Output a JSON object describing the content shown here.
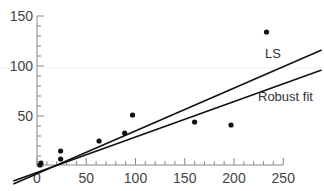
{
  "chart_data": {
    "type": "scatter",
    "title": "",
    "xlabel": "",
    "ylabel": "",
    "xlim": [
      0,
      250
    ],
    "ylim": [
      0,
      150
    ],
    "x_ticks": [
      0,
      50,
      100,
      150,
      200,
      250
    ],
    "y_ticks": [
      50,
      100,
      150
    ],
    "x_tick_labels": [
      "0",
      "50",
      "100",
      "150",
      "200",
      "250"
    ],
    "y_tick_labels": [
      "50",
      "100",
      "150"
    ],
    "grid": false,
    "points": [
      {
        "x": 3,
        "y": 1
      },
      {
        "x": 4,
        "y": 3
      },
      {
        "x": 24,
        "y": 15
      },
      {
        "x": 24,
        "y": 7
      },
      {
        "x": 63,
        "y": 25
      },
      {
        "x": 89,
        "y": 33
      },
      {
        "x": 97,
        "y": 51
      },
      {
        "x": 160,
        "y": 44
      },
      {
        "x": 197,
        "y": 41
      },
      {
        "x": 233,
        "y": 134
      }
    ],
    "series": [
      {
        "name": "LS",
        "type": "line",
        "x": [
          -24,
          289
        ],
        "y": [
          -18,
          116
        ],
        "label": "LS"
      },
      {
        "name": "Robust fit",
        "type": "line",
        "x": [
          -24,
          289
        ],
        "y": [
          -15,
          96
        ],
        "label": "Robust fit"
      }
    ],
    "annotations": [
      {
        "text": "LS",
        "x": 258,
        "y": 120
      },
      {
        "text": "Robust fit",
        "x": 245,
        "y": 74
      }
    ]
  },
  "labels": {
    "ls": "LS",
    "robust": "Robust fit"
  },
  "colors": {
    "ink": "#111111",
    "axis": "#888888",
    "text": "#444444"
  }
}
